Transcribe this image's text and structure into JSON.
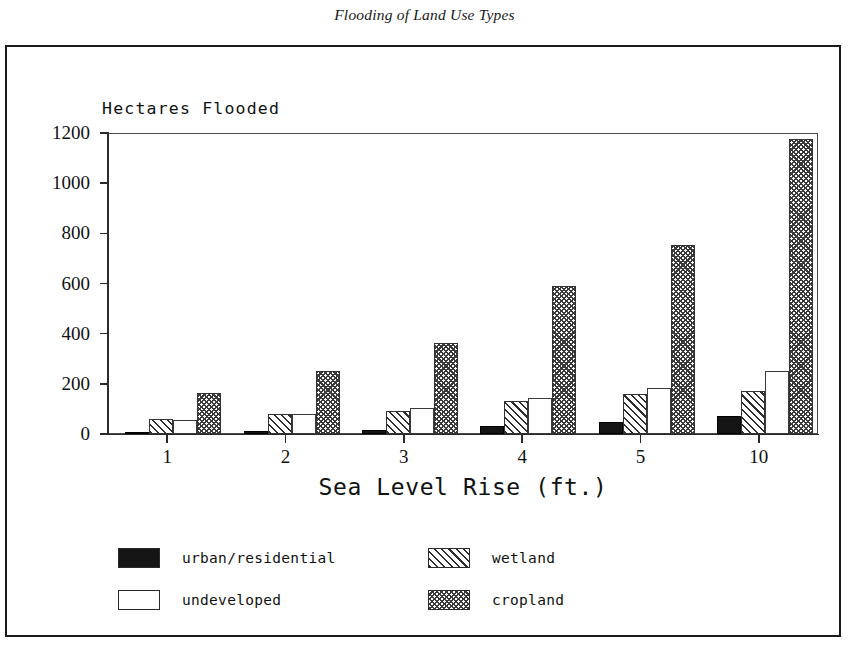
{
  "caption": "Flooding of Land Use Types",
  "chart_data": {
    "type": "bar",
    "title": "Flooding of Land Use Types",
    "ylabel": "Hectares Flooded",
    "xlabel": "Sea Level Rise (ft.)",
    "categories": [
      "1",
      "2",
      "3",
      "4",
      "5",
      "10"
    ],
    "ylim": [
      0,
      1200
    ],
    "yticks": [
      0,
      200,
      400,
      600,
      800,
      1000,
      1200
    ],
    "ytick_labels": [
      "0",
      "200",
      "400",
      "600",
      "800",
      "1000",
      "1200"
    ],
    "grid": false,
    "legend_position": "below",
    "series": [
      {
        "name": "urban/residential",
        "pattern": "solid-black",
        "values": [
          5,
          12,
          18,
          32,
          48,
          72
        ]
      },
      {
        "name": "wetland",
        "pattern": "diagonal-hatch",
        "values": [
          60,
          78,
          92,
          132,
          158,
          172
        ]
      },
      {
        "name": "undeveloped",
        "pattern": "empty-white",
        "values": [
          55,
          78,
          105,
          145,
          182,
          252
        ]
      },
      {
        "name": "cropland",
        "pattern": "cross-hatch-gray",
        "values": [
          165,
          252,
          362,
          592,
          753,
          1178
        ]
      }
    ]
  },
  "legend": {
    "items": [
      {
        "label": "urban/residential",
        "pattern": "solid-black"
      },
      {
        "label": "undeveloped",
        "pattern": "empty-white"
      },
      {
        "label": "wetland",
        "pattern": "diagonal-hatch"
      },
      {
        "label": "cropland",
        "pattern": "cross-hatch-gray"
      }
    ]
  },
  "colors": {
    "ink": "#1b1b1b",
    "axis": "#2a2a2a",
    "urban": "#151515",
    "undeveloped": "#ffffff",
    "hatch": "#2e2e2e",
    "cropland": "#3a3a3a"
  }
}
